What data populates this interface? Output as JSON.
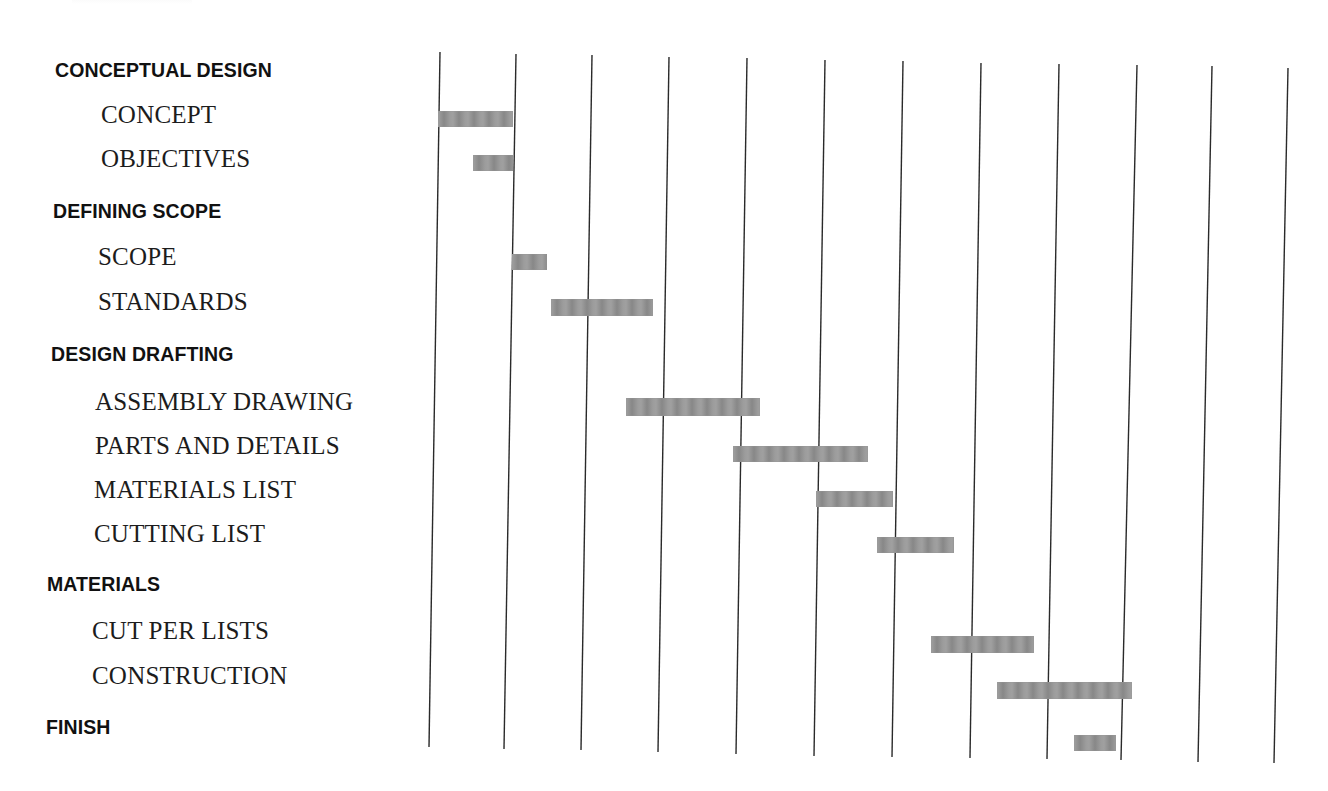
{
  "figure": {
    "title_cut": "",
    "background": "#ffffff",
    "line_color": "#2a2a2a",
    "bar_color": "#a0a0a0"
  },
  "labels": [
    {
      "text": "CONCEPTUAL DESIGN",
      "kind": "heading",
      "x": 55,
      "y": 61
    },
    {
      "text": "CONCEPT",
      "kind": "task",
      "x": 101,
      "y": 102
    },
    {
      "text": "OBJECTIVES",
      "kind": "task",
      "x": 101,
      "y": 146
    },
    {
      "text": "DEFINING SCOPE",
      "kind": "heading",
      "x": 53,
      "y": 202
    },
    {
      "text": "SCOPE",
      "kind": "task",
      "x": 98,
      "y": 244
    },
    {
      "text": "STANDARDS",
      "kind": "task",
      "x": 98,
      "y": 289
    },
    {
      "text": "DESIGN DRAFTING",
      "kind": "heading",
      "x": 51,
      "y": 345
    },
    {
      "text": "ASSEMBLY DRAWING",
      "kind": "task",
      "x": 95,
      "y": 389
    },
    {
      "text": "PARTS AND DETAILS",
      "kind": "task",
      "x": 95,
      "y": 433
    },
    {
      "text": "MATERIALS LIST",
      "kind": "task",
      "x": 94,
      "y": 477
    },
    {
      "text": "CUTTING LIST",
      "kind": "task",
      "x": 94,
      "y": 521
    },
    {
      "text": "MATERIALS",
      "kind": "heading",
      "x": 47,
      "y": 575
    },
    {
      "text": "CUT PER LISTS",
      "kind": "task",
      "x": 92,
      "y": 618
    },
    {
      "text": "CONSTRUCTION",
      "kind": "task",
      "x": 92,
      "y": 663
    },
    {
      "text": "FINISH",
      "kind": "heading",
      "x": 46,
      "y": 718
    }
  ],
  "gridlines": [
    {
      "x1": 440,
      "y1": 52,
      "x2": 429,
      "y2": 747
    },
    {
      "x1": 516,
      "y1": 54,
      "x2": 504,
      "y2": 749
    },
    {
      "x1": 592,
      "y1": 55,
      "x2": 581,
      "y2": 750
    },
    {
      "x1": 669,
      "y1": 57,
      "x2": 658,
      "y2": 752
    },
    {
      "x1": 747,
      "y1": 58,
      "x2": 736,
      "y2": 754
    },
    {
      "x1": 825,
      "y1": 60,
      "x2": 814,
      "y2": 756
    },
    {
      "x1": 903,
      "y1": 61,
      "x2": 892,
      "y2": 757
    },
    {
      "x1": 981,
      "y1": 63,
      "x2": 970,
      "y2": 758
    },
    {
      "x1": 1059,
      "y1": 64,
      "x2": 1047,
      "y2": 759
    },
    {
      "x1": 1137,
      "y1": 65,
      "x2": 1121,
      "y2": 760
    },
    {
      "x1": 1212,
      "y1": 66,
      "x2": 1198,
      "y2": 762
    },
    {
      "x1": 1288,
      "y1": 68,
      "x2": 1274,
      "y2": 763
    }
  ],
  "bars": [
    {
      "task": "CONCEPT",
      "x": 438,
      "y": 111,
      "w": 75,
      "h": 16
    },
    {
      "task": "OBJECTIVES",
      "x": 473,
      "y": 155,
      "w": 40,
      "h": 16
    },
    {
      "task": "SCOPE",
      "x": 512,
      "y": 254,
      "w": 35,
      "h": 16
    },
    {
      "task": "STANDARDS",
      "x": 551,
      "y": 299,
      "w": 102,
      "h": 17
    },
    {
      "task": "ASSEMBLY DRAWING",
      "x": 626,
      "y": 398,
      "w": 134,
      "h": 18
    },
    {
      "task": "PARTS AND DETAILS",
      "x": 733,
      "y": 446,
      "w": 135,
      "h": 16
    },
    {
      "task": "MATERIALS LIST",
      "x": 816,
      "y": 491,
      "w": 77,
      "h": 16
    },
    {
      "task": "CUTTING LIST",
      "x": 877,
      "y": 537,
      "w": 77,
      "h": 16
    },
    {
      "task": "CUT PER LISTS",
      "x": 931,
      "y": 636,
      "w": 103,
      "h": 17
    },
    {
      "task": "CONSTRUCTION",
      "x": 997,
      "y": 682,
      "w": 135,
      "h": 17
    },
    {
      "task": "FINISH",
      "x": 1074,
      "y": 735,
      "w": 42,
      "h": 16
    }
  ],
  "chart_data": {
    "type": "bar",
    "subtype": "gantt",
    "title": "",
    "xlabel": "",
    "ylabel": "",
    "grid": true,
    "grid_columns": 11,
    "xlim": [
      0,
      11
    ],
    "legend": null,
    "groups": [
      {
        "name": "CONCEPTUAL DESIGN",
        "tasks": [
          "CONCEPT",
          "OBJECTIVES"
        ]
      },
      {
        "name": "DEFINING SCOPE",
        "tasks": [
          "SCOPE",
          "STANDARDS"
        ]
      },
      {
        "name": "DESIGN DRAFTING",
        "tasks": [
          "ASSEMBLY DRAWING",
          "PARTS AND DETAILS",
          "MATERIALS LIST",
          "CUTTING LIST"
        ]
      },
      {
        "name": "MATERIALS",
        "tasks": [
          "CUT PER LISTS",
          "CONSTRUCTION"
        ]
      },
      {
        "name": "FINISH",
        "tasks": [
          "FINISH"
        ]
      }
    ],
    "categories": [
      "CONCEPT",
      "OBJECTIVES",
      "SCOPE",
      "STANDARDS",
      "ASSEMBLY DRAWING",
      "PARTS AND DETAILS",
      "MATERIALS LIST",
      "CUTTING LIST",
      "CUT PER LISTS",
      "CONSTRUCTION",
      "FINISH"
    ],
    "series": [
      {
        "name": "start",
        "values": [
          0.0,
          0.45,
          1.0,
          1.5,
          2.5,
          3.9,
          5.0,
          5.75,
          6.5,
          7.35,
          8.35
        ]
      },
      {
        "name": "end",
        "values": [
          1.0,
          1.0,
          1.45,
          2.85,
          4.25,
          5.65,
          6.0,
          6.75,
          7.8,
          9.05,
          8.9
        ]
      }
    ]
  }
}
